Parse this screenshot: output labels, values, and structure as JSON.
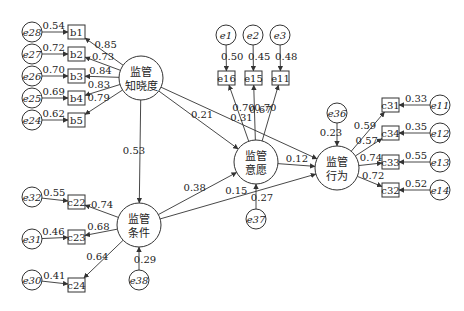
{
  "diagram": {
    "type": "structural-equation-model",
    "latent": [
      {
        "id": "L1",
        "line1": "监管",
        "line2": "知晓度",
        "cx": 141,
        "cy": 78,
        "r": 22
      },
      {
        "id": "L2",
        "line1": "监管",
        "line2": "条件",
        "cx": 139,
        "cy": 225,
        "r": 22
      },
      {
        "id": "L3",
        "line1": "监管",
        "line2": "意愿",
        "cx": 256,
        "cy": 162,
        "r": 22
      },
      {
        "id": "L4",
        "line1": "监管",
        "line2": "行为",
        "cx": 337,
        "cy": 168,
        "r": 22
      }
    ],
    "observed": [
      {
        "id": "b1",
        "label": "b1",
        "x": 68,
        "y": 25
      },
      {
        "id": "b2",
        "label": "b2",
        "x": 68,
        "y": 47
      },
      {
        "id": "b3",
        "label": "b3",
        "x": 68,
        "y": 69
      },
      {
        "id": "b4",
        "label": "b4",
        "x": 68,
        "y": 91
      },
      {
        "id": "b5",
        "label": "b5",
        "x": 68,
        "y": 113
      },
      {
        "id": "e16",
        "label": "e16",
        "x": 218,
        "y": 71
      },
      {
        "id": "e15",
        "label": "e15",
        "x": 245,
        "y": 71
      },
      {
        "id": "e11o",
        "label": "e11",
        "x": 272,
        "y": 71
      },
      {
        "id": "c31",
        "label": "c31",
        "x": 382,
        "y": 98
      },
      {
        "id": "c34",
        "label": "c34",
        "x": 382,
        "y": 126
      },
      {
        "id": "c33",
        "label": "c33",
        "x": 382,
        "y": 155
      },
      {
        "id": "c32",
        "label": "c32",
        "x": 382,
        "y": 183
      },
      {
        "id": "c22",
        "label": "c22",
        "x": 68,
        "y": 195
      },
      {
        "id": "c23",
        "label": "c23",
        "x": 68,
        "y": 230
      },
      {
        "id": "c24",
        "label": "c24",
        "x": 68,
        "y": 278
      }
    ],
    "errors": [
      {
        "id": "e28",
        "label": "e28",
        "cx": 32,
        "cy": 32,
        "target": "b1",
        "value": "0.54"
      },
      {
        "id": "e27",
        "label": "e27",
        "cx": 32,
        "cy": 54,
        "target": "b2",
        "value": "0.72"
      },
      {
        "id": "e26",
        "label": "e26",
        "cx": 32,
        "cy": 76,
        "target": "b3",
        "value": "0.70"
      },
      {
        "id": "e25",
        "label": "e25",
        "cx": 32,
        "cy": 98,
        "target": "b4",
        "value": "0.69"
      },
      {
        "id": "e24",
        "label": "e24",
        "cx": 32,
        "cy": 120,
        "target": "b5",
        "value": "0.62"
      },
      {
        "id": "e1",
        "label": "e1",
        "cx": 226,
        "cy": 35,
        "target": "e16",
        "value": "0.50"
      },
      {
        "id": "e2",
        "label": "e2",
        "cx": 253,
        "cy": 35,
        "target": "e15",
        "value": "0.45"
      },
      {
        "id": "e3",
        "label": "e3",
        "cx": 280,
        "cy": 35,
        "target": "e11o",
        "value": "0.48"
      },
      {
        "id": "e11",
        "label": "e11",
        "cx": 440,
        "cy": 105,
        "target": "c31",
        "value": "0.33"
      },
      {
        "id": "e12",
        "label": "e12",
        "cx": 440,
        "cy": 133,
        "target": "c34",
        "value": "0.35"
      },
      {
        "id": "e13",
        "label": "e13",
        "cx": 440,
        "cy": 162,
        "target": "c33",
        "value": "0.55"
      },
      {
        "id": "e14",
        "label": "e14",
        "cx": 440,
        "cy": 190,
        "target": "c32",
        "value": "0.52"
      },
      {
        "id": "e32",
        "label": "e32",
        "cx": 32,
        "cy": 197,
        "target": "c22",
        "value": "0.55"
      },
      {
        "id": "e31",
        "label": "e31",
        "cx": 32,
        "cy": 239,
        "target": "c23",
        "value": "0.46"
      },
      {
        "id": "e30",
        "label": "e30",
        "cx": 32,
        "cy": 280,
        "target": "c24",
        "value": "0.41"
      },
      {
        "id": "e36",
        "label": "e36",
        "cx": 337,
        "cy": 113,
        "target": "L4",
        "value": "0.23"
      },
      {
        "id": "e37",
        "label": "e37",
        "cx": 256,
        "cy": 219,
        "target": "L3",
        "value": "0.27"
      },
      {
        "id": "e38",
        "label": "e38",
        "cx": 139,
        "cy": 280,
        "target": "L2",
        "value": "0.29"
      }
    ],
    "loadings": [
      {
        "from": "L1",
        "to": "b1",
        "value": "0.85"
      },
      {
        "from": "L1",
        "to": "b2",
        "value": "0.73"
      },
      {
        "from": "L1",
        "to": "b3",
        "value": "0.84"
      },
      {
        "from": "L1",
        "to": "b4",
        "value": "0.83"
      },
      {
        "from": "L1",
        "to": "b5",
        "value": "0.79"
      },
      {
        "from": "L3",
        "to": "e16",
        "value": "0.70"
      },
      {
        "from": "L3",
        "to": "e15",
        "value": "0.67"
      },
      {
        "from": "L3",
        "to": "e11o",
        "value": "0.70"
      },
      {
        "from": "L4",
        "to": "c31",
        "value": "0.59"
      },
      {
        "from": "L4",
        "to": "c34",
        "value": "0.57"
      },
      {
        "from": "L4",
        "to": "c33",
        "value": "0.74"
      },
      {
        "from": "L4",
        "to": "c32",
        "value": "0.72"
      },
      {
        "from": "L2",
        "to": "c22",
        "value": "0.74"
      },
      {
        "from": "L2",
        "to": "c23",
        "value": "0.68"
      },
      {
        "from": "L2",
        "to": "c24",
        "value": "0.64"
      }
    ],
    "paths": [
      {
        "from": "L1",
        "to": "L4",
        "value": "0.31"
      },
      {
        "from": "L1",
        "to": "L3",
        "value": "0.21"
      },
      {
        "from": "L1",
        "to": "L2",
        "value": "0.53"
      },
      {
        "from": "L2",
        "to": "L3",
        "value": "0.38"
      },
      {
        "from": "L2",
        "to": "L4",
        "value": "0.15"
      },
      {
        "from": "L3",
        "to": "L4",
        "value": "0.12"
      }
    ]
  }
}
